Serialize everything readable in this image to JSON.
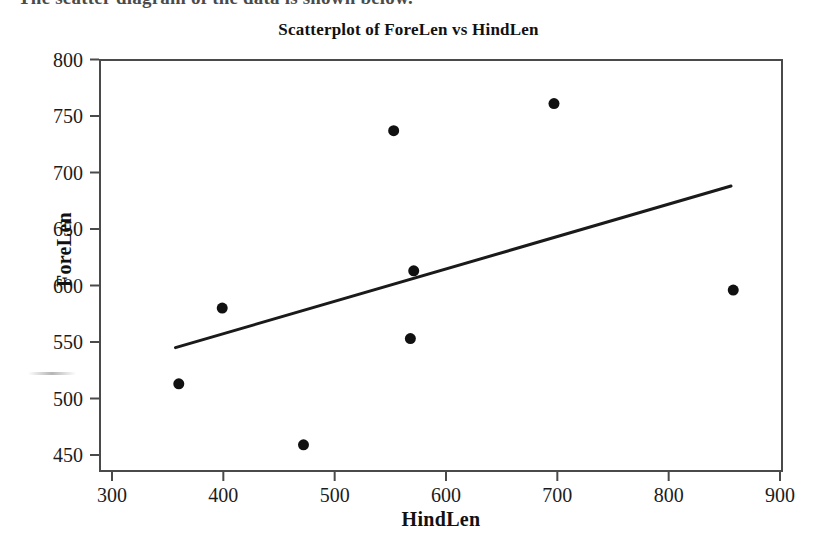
{
  "page": {
    "caption": "The scatter diagram of the data is shown below."
  },
  "chart_data": {
    "type": "scatter",
    "title": "Scatterplot of ForeLen vs HindLen",
    "xlabel": "HindLen",
    "ylabel": "ForeLen",
    "xlim": [
      280,
      900
    ],
    "ylim": [
      440,
      805
    ],
    "xticks": [
      300,
      400,
      500,
      600,
      700,
      800,
      900
    ],
    "yticks": [
      450,
      500,
      550,
      600,
      650,
      700,
      750,
      800
    ],
    "xtick_labels": [
      "300",
      "400",
      "500",
      "600",
      "700",
      "800",
      "900"
    ],
    "ytick_labels": [
      "450",
      "500",
      "550",
      "600",
      "650",
      "700",
      "750",
      "800"
    ],
    "grid": false,
    "legend": null,
    "marker": {
      "shape": "circle",
      "color": "#111111",
      "size": 11
    },
    "series": [
      {
        "name": "ForeLen vs HindLen",
        "x": [
          360,
          399,
          472,
          553,
          571,
          568,
          697,
          858
        ],
        "y": [
          513,
          580,
          459,
          737,
          613,
          553,
          761,
          596
        ]
      }
    ],
    "points": [
      {
        "x": 360,
        "y": 513
      },
      {
        "x": 399,
        "y": 580
      },
      {
        "x": 472,
        "y": 459
      },
      {
        "x": 553,
        "y": 737
      },
      {
        "x": 571,
        "y": 613
      },
      {
        "x": 568,
        "y": 553
      },
      {
        "x": 697,
        "y": 761
      },
      {
        "x": 858,
        "y": 596
      }
    ],
    "fit_line": {
      "name": "regression-line",
      "x_start": 357,
      "y_start": 545,
      "x_end": 856,
      "y_end": 688,
      "color": "#1a1a1a",
      "width": 3
    }
  }
}
